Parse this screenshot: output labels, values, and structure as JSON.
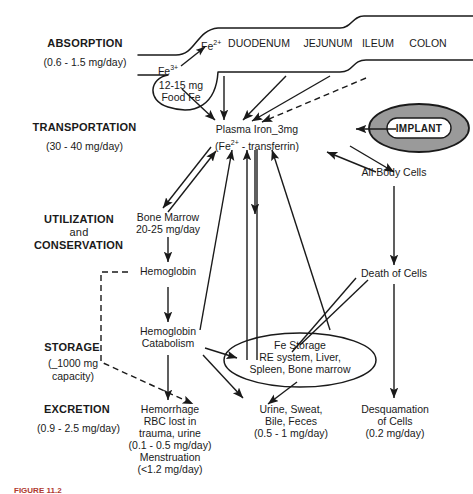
{
  "figure": {
    "caption": "FIGURE 11.2",
    "background": "#ffffff",
    "ink": "#1a1a1a",
    "implant_fill": "#9a9a9a"
  },
  "stages": [
    {
      "name": "absorption",
      "label": "ABSORPTION",
      "sub": "(0.6 - 1.5 mg/day)"
    },
    {
      "name": "transportation",
      "label": "TRANSPORTATION",
      "sub": "(30 - 40 mg/day)"
    },
    {
      "name": "utilization",
      "label": "UTILIZATION",
      "label2": "and",
      "label3": "CONSERVATION",
      "sub": ""
    },
    {
      "name": "storage",
      "label": "STORAGE",
      "sub": "(_1000 mg",
      "sub2": "capacity)"
    },
    {
      "name": "excretion",
      "label": "EXCRETION",
      "sub": "(0.9 - 2.5 mg/day)"
    }
  ],
  "gut": {
    "segments": [
      "DUODENUM",
      "JEJUNUM",
      "ILEUM",
      "COLON"
    ],
    "fe2_prefix": "Fe",
    "fe2_charge": "2+",
    "stomach_line1": "12-15 mg",
    "stomach_line2": "Food Fe",
    "fe3_prefix": "Fe",
    "fe3_charge": "3+"
  },
  "nodes": {
    "plasma_iron_line1": "Plasma Iron_3mg",
    "plasma_iron_line2a": "(Fe",
    "plasma_iron_charge": "2+",
    "plasma_iron_line2b": " - transferrin)",
    "implant": "IMPLANT",
    "all_body_cells": "All Body Cells",
    "bone_marrow_line1": "Bone Marrow",
    "bone_marrow_line2": "20-25 mg/day",
    "hemoglobin": "Hemoglobin",
    "hemoglobin_catabolism_line1": "Hemoglobin",
    "hemoglobin_catabolism_line2": "Catabolism",
    "death_of_cells": "Death of Cells",
    "fe_storage_line1": "Fe Storage",
    "fe_storage_line2": "RE system, Liver,",
    "fe_storage_line3": "Spleen, Bone marrow",
    "hemorrhage_line1": "Hemorrhage",
    "hemorrhage_line2": "RBC lost in",
    "hemorrhage_line3": "trauma, urine",
    "hemorrhage_line4": "(0.1 - 0.5 mg/day)",
    "hemorrhage_line5": "Menstruation",
    "hemorrhage_line6": "(<1.2 mg/day)",
    "urine_line1": "Urine, Sweat,",
    "urine_line2": "Bile, Feces",
    "urine_line3": "(0.5 - 1 mg/day)",
    "desquamation_line1": "Desquamation",
    "desquamation_line2": "of Cells",
    "desquamation_line3": "(0.2 mg/day)"
  }
}
